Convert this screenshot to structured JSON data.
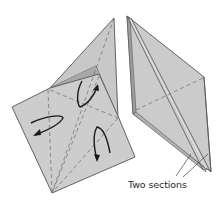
{
  "diagram": {
    "type": "origami-fold-step",
    "figures": [
      {
        "name": "left-figure",
        "description": "Square base with kite flap, three curved fold arrows"
      },
      {
        "name": "right-figure",
        "description": "Narrow folded diamond shape with layered edges"
      }
    ],
    "annotation": {
      "text": "Two sections"
    },
    "colors": {
      "paper": "#c9c9c9",
      "paper_light": "#d4d4d4",
      "paper_shadow": "#a9a9a9",
      "edge": "#555555",
      "dash": "#6a6a6a",
      "arrow": "#1a1a1a",
      "background": "#ffffff"
    }
  }
}
